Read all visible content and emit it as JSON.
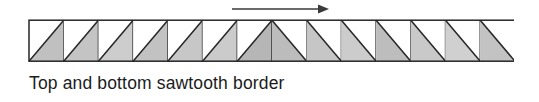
{
  "figure": {
    "caption": "Top and bottom sawtooth border",
    "arrow": {
      "name": "direction-arrow",
      "label": "",
      "direction": "right",
      "color": "#3a3a3a",
      "x1": 4,
      "y1": 9,
      "x2": 96,
      "y2": 9
    },
    "band": {
      "name": "sawtooth-border-band",
      "cell_count": 14,
      "cell_width": 34.71,
      "band_height": 41,
      "outline_color": "#262626",
      "background_color": "#ffffff",
      "cells": [
        {
          "index": 1,
          "diagonal": "bottom-left-to-top-right",
          "shaded_half": "lower-right",
          "fill": "#c0c0c0"
        },
        {
          "index": 2,
          "diagonal": "bottom-left-to-top-right",
          "shaded_half": "lower-right",
          "fill": "#c4c4c4"
        },
        {
          "index": 3,
          "diagonal": "bottom-left-to-top-right",
          "shaded_half": "lower-right",
          "fill": "#cdcdcd"
        },
        {
          "index": 4,
          "diagonal": "bottom-left-to-top-right",
          "shaded_half": "lower-right",
          "fill": "#c2c2c2"
        },
        {
          "index": 5,
          "diagonal": "bottom-left-to-top-right",
          "shaded_half": "lower-right",
          "fill": "#c7c7c7"
        },
        {
          "index": 6,
          "diagonal": "bottom-left-to-top-right",
          "shaded_half": "lower-right",
          "fill": "#cbcbcb"
        },
        {
          "index": 7,
          "diagonal": "bottom-left-to-top-right",
          "shaded_half": "lower-right",
          "fill": "#b6b6b6"
        },
        {
          "index": 8,
          "diagonal": "top-left-to-bottom-right",
          "shaded_half": "lower-left",
          "fill": "#bcbcbc"
        },
        {
          "index": 9,
          "diagonal": "top-left-to-bottom-right",
          "shaded_half": "lower-left",
          "fill": "#c6c6c6"
        },
        {
          "index": 10,
          "diagonal": "top-left-to-bottom-right",
          "shaded_half": "lower-left",
          "fill": "#cccccc"
        },
        {
          "index": 11,
          "diagonal": "top-left-to-bottom-right",
          "shaded_half": "lower-left",
          "fill": "#bdbdbd"
        },
        {
          "index": 12,
          "diagonal": "top-left-to-bottom-right",
          "shaded_half": "lower-left",
          "fill": "#c9c9c9"
        },
        {
          "index": 13,
          "diagonal": "top-left-to-bottom-right",
          "shaded_half": "lower-left",
          "fill": "#d0d0d0"
        },
        {
          "index": 14,
          "diagonal": "top-left-to-bottom-right",
          "shaded_half": "lower-left",
          "fill": "#c3c3c3"
        }
      ]
    }
  }
}
